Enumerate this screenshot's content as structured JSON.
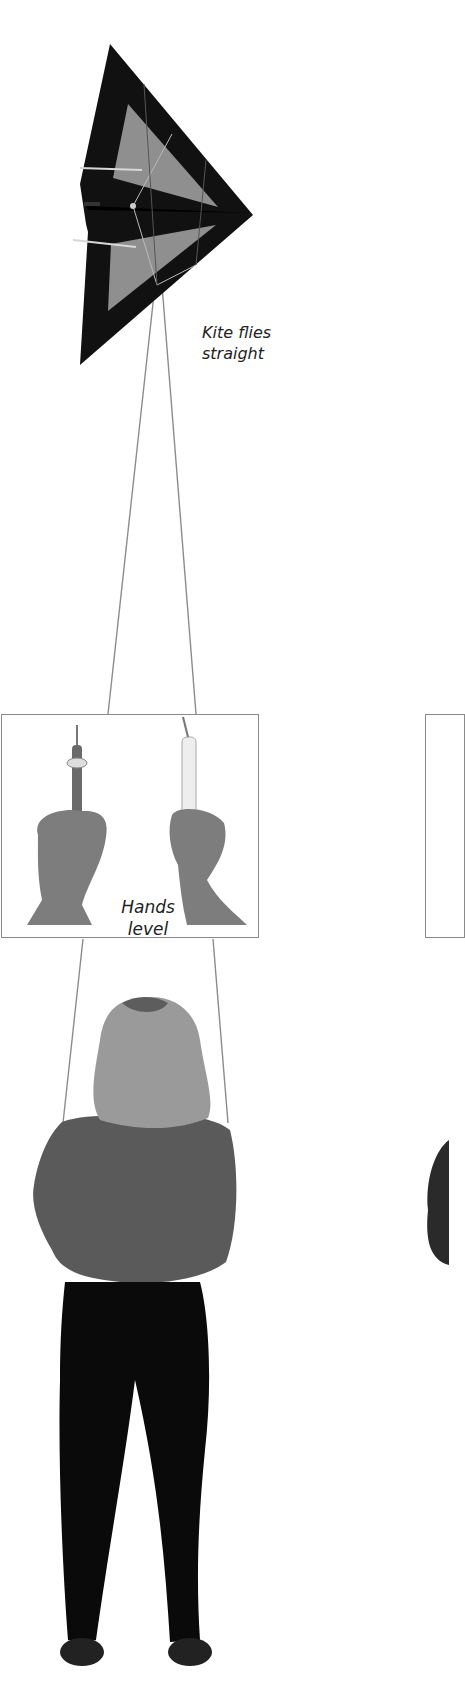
{
  "illustration": {
    "kite": {
      "caption_line1": "Kite flies",
      "caption_line2": "straight",
      "colors": {
        "frame": "#111111",
        "panel": "#8f8f8f",
        "spar": "#d8d8d8"
      }
    },
    "hands_panel": {
      "caption_line1": "Hands",
      "caption_line2": "level",
      "border_color": "#8a8a8a"
    },
    "flier": {
      "sweater_color": "#5a5a5a",
      "hair_color": "#9a9a9a",
      "trousers_color": "#0a0a0a"
    },
    "line_color": "#8c8c8c"
  }
}
